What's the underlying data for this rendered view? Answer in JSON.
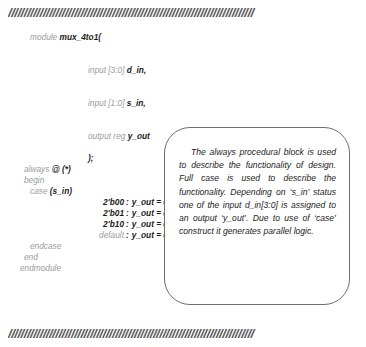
{
  "dividers": {
    "top": "//////////////////////////////////////////////////////////////////////////////",
    "bottom": "//////////////////////////////////////////////////////////////////////////////"
  },
  "code": {
    "module_kw": "module",
    "module_name": "mux_4to1(",
    "port_in_d_kw": "input [3:0]",
    "port_in_d_name": "d_in,",
    "port_in_s_kw": "input [1:0]",
    "port_in_s_name": "s_in,",
    "port_out_kw": "output reg",
    "port_out_name": "y_out",
    "close_paren": ");",
    "always_kw": "always",
    "always_sens": "@ (*)",
    "begin_kw": "begin",
    "case_kw": "case",
    "case_expr": "(s_in)",
    "cases": [
      {
        "label": "2'b00",
        "sep": ":",
        "stmt": "y_out = d_in[0];",
        "label_style": "id"
      },
      {
        "label": "2'b01",
        "sep": ":",
        "stmt": "y_out = d_in[1];",
        "label_style": "id"
      },
      {
        "label": "2'b10",
        "sep": ":",
        "stmt": "y_out = d_in[2];",
        "label_style": "id"
      },
      {
        "label": "default",
        "sep": ":",
        "stmt": "y_out = d_in[3];",
        "label_style": "kw"
      }
    ],
    "endcase_kw": "endcase",
    "end_kw": "end",
    "endmodule_kw": "endmodule"
  },
  "note": {
    "text": "The always procedural block is used to describe the function­ality of design. Full case is used to describe the function­ality. Depending on ‘s_in’ sta­tus one of the input d_in[3:0] is assigned to an output ‘y_out’. Due to use of ‘case’ construct it generates parallel logic."
  },
  "colors": {
    "keyword": "#9b9b9d",
    "identifier": "#1b1b1b",
    "divider": "#59595b",
    "box_border": "#6e6e70",
    "background": "#ffffff"
  }
}
